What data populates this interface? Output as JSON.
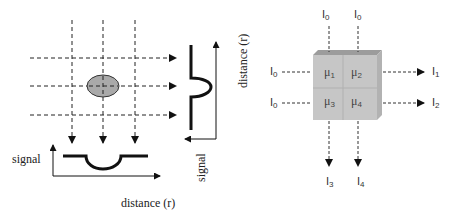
{
  "left_panel": {
    "bottom_axis_y_label": "signal",
    "bottom_axis_x_label": "distance (r)",
    "right_axis_y_label": "signal",
    "right_axis_x_label": "distance (r)",
    "object_shape": "ellipse",
    "object_color": "#a9a9a9",
    "ray_count_vertical": 3,
    "ray_count_horizontal": 3
  },
  "right_panel": {
    "inputs_top": [
      {
        "base": "I",
        "sub": "0"
      },
      {
        "base": "I",
        "sub": "0"
      }
    ],
    "inputs_left": [
      {
        "base": "I",
        "sub": "0"
      },
      {
        "base": "I",
        "sub": "0"
      }
    ],
    "outputs_right": [
      {
        "base": "I",
        "sub": "1"
      },
      {
        "base": "I",
        "sub": "2"
      }
    ],
    "outputs_bottom": [
      {
        "base": "I",
        "sub": "3"
      },
      {
        "base": "I",
        "sub": "4"
      }
    ],
    "cells": [
      {
        "base": "μ",
        "sub": "1"
      },
      {
        "base": "μ",
        "sub": "2"
      },
      {
        "base": "μ",
        "sub": "3"
      },
      {
        "base": "μ",
        "sub": "4"
      }
    ],
    "cube_colors": {
      "front": "#c6c6c6",
      "top": "#9c9c9c",
      "side": "#b2b2b2"
    }
  }
}
